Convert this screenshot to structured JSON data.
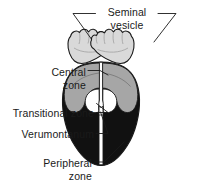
{
  "figure": {
    "type": "anatomical-line-diagram",
    "background_color": "#ffffff",
    "outline_color": "#1a1a1a",
    "palette": {
      "seminal_vesicle_fill": "#d9d9d9",
      "central_zone_fill": "#a6a6a6",
      "peripheral_zone_fill": "#111111",
      "transitional_zone_fill": "#ffffff",
      "urethra_fill": "#ffffff",
      "leader_line_color": "#1a1a1a",
      "text_color": "#1a1a1a"
    }
  },
  "labels": {
    "seminal_vesicle": {
      "line1": "Seminal",
      "line2": "vesicle",
      "target": "seminal-vesicle",
      "leaders": 2
    },
    "central_zone": {
      "line1": "Central",
      "line2": "zone",
      "target": "central-zone",
      "leaders": 1
    },
    "transitional_zone": {
      "line1": "Transitional zone",
      "target": "transitional-zone",
      "leaders": 1
    },
    "verumontanum": {
      "line1": "Verumontanum",
      "target": "verumontanum",
      "leaders": 1
    },
    "peripheral_zone": {
      "line1": "Peripheral",
      "line2": "zone",
      "target": "peripheral-zone",
      "leaders": 1
    }
  },
  "structures": [
    {
      "id": "seminal-vesicle-left",
      "name": "Seminal vesicle (left)",
      "fill": "#d9d9d9"
    },
    {
      "id": "seminal-vesicle-right",
      "name": "Seminal vesicle (right)",
      "fill": "#d9d9d9"
    },
    {
      "id": "peripheral-zone",
      "name": "Peripheral zone",
      "fill": "#111111"
    },
    {
      "id": "central-zone-left",
      "name": "Central zone (left)",
      "fill": "#a6a6a6"
    },
    {
      "id": "central-zone-right",
      "name": "Central zone (right)",
      "fill": "#a6a6a6"
    },
    {
      "id": "transitional-zone",
      "name": "Transitional zone",
      "fill": "#ffffff"
    },
    {
      "id": "urethra",
      "name": "Urethra / verumontanum",
      "fill": "#ffffff"
    }
  ]
}
